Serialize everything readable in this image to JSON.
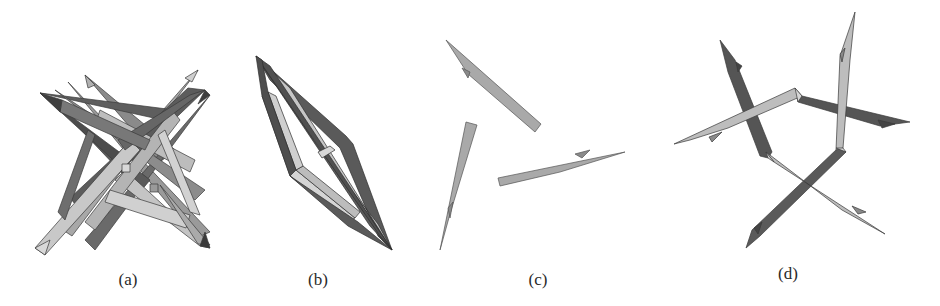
{
  "figure": {
    "panels": [
      {
        "id": "a",
        "label": "(a)",
        "description": "interlocked star of twelve tapered sticks"
      },
      {
        "id": "b",
        "label": "(b)",
        "description": "rhombic frame of tapered sticks"
      },
      {
        "id": "c",
        "label": "(c)",
        "description": "three separated tapered sticks"
      },
      {
        "id": "d",
        "label": "(d)",
        "description": "pinwheel of bent tapered sticks"
      }
    ],
    "colors": {
      "dark": "#555555",
      "mid": "#7d7d7d",
      "light": "#bdbdbd",
      "lighter": "#d6d6d6",
      "edge": "#3a3a3a"
    }
  }
}
